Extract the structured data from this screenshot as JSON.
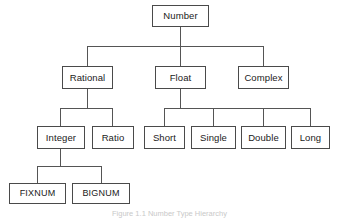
{
  "figure": {
    "title": "Number type hierarchy",
    "caption": "Figure 1.1  Number Type Hierarchy",
    "background_color": "#ffffff",
    "border_color": "#4a4a4a",
    "text_color": "#1a1a1a",
    "line_color": "#555555"
  },
  "nodes": {
    "number": {
      "label": "Number",
      "x": 152,
      "y": 5,
      "w": 57,
      "h": 22
    },
    "rational": {
      "label": "Rational",
      "x": 62,
      "y": 66,
      "w": 51,
      "h": 23
    },
    "float": {
      "label": "Float",
      "x": 155,
      "y": 66,
      "w": 51,
      "h": 23
    },
    "complex": {
      "label": "Complex",
      "x": 238,
      "y": 66,
      "w": 51,
      "h": 23
    },
    "integer": {
      "label": "Integer",
      "x": 37,
      "y": 126,
      "w": 48,
      "h": 23
    },
    "ratio": {
      "label": "Ratio",
      "x": 92,
      "y": 126,
      "w": 42,
      "h": 23
    },
    "short": {
      "label": "Short",
      "x": 144,
      "y": 126,
      "w": 41,
      "h": 23
    },
    "single": {
      "label": "Single",
      "x": 191,
      "y": 126,
      "w": 45,
      "h": 23
    },
    "double": {
      "label": "Double",
      "x": 241,
      "y": 126,
      "w": 45,
      "h": 23
    },
    "long": {
      "label": "Long",
      "x": 291,
      "y": 126,
      "w": 39,
      "h": 23
    },
    "fixnum": {
      "label": "FIXNUM",
      "x": 9,
      "y": 183,
      "w": 57,
      "h": 21
    },
    "bignum": {
      "label": "BIGNUM",
      "x": 72,
      "y": 183,
      "w": 58,
      "h": 21
    }
  },
  "edges": [
    {
      "from": "number",
      "to": "rational"
    },
    {
      "from": "number",
      "to": "float"
    },
    {
      "from": "number",
      "to": "complex"
    },
    {
      "from": "rational",
      "to": "integer"
    },
    {
      "from": "rational",
      "to": "ratio"
    },
    {
      "from": "float",
      "to": "short"
    },
    {
      "from": "float",
      "to": "single"
    },
    {
      "from": "float",
      "to": "double"
    },
    {
      "from": "float",
      "to": "long"
    },
    {
      "from": "integer",
      "to": "fixnum"
    },
    {
      "from": "integer",
      "to": "bignum"
    }
  ],
  "edge_geometry": {
    "bus_level_1_y": 46,
    "bus_level_2_y": 108,
    "bus_level_3_y": 166
  }
}
